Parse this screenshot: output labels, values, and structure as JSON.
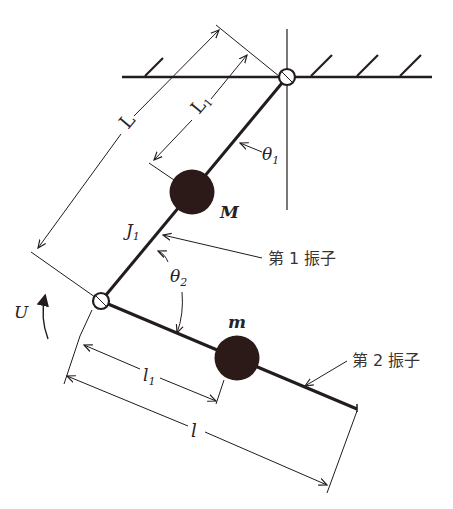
{
  "diagram": {
    "colors": {
      "ink": "#231c1c",
      "mass": "#2b1a17",
      "background": "#ffffff"
    },
    "labels": {
      "L": "L",
      "L1": "L",
      "L1_sub": "1",
      "theta1": "θ",
      "theta1_sub": "1",
      "M": "M",
      "J1": "J",
      "J1_sub": "1",
      "theta2": "θ",
      "theta2_sub": "2",
      "pendulum1": "第 1 振子",
      "pendulum2": "第 2 振子",
      "U": "U",
      "m": "m",
      "l1": "l",
      "l1_sub": "1",
      "l": "l"
    },
    "components": [
      {
        "name": "ceiling",
        "type": "fixed-support"
      },
      {
        "name": "pivot",
        "type": "hinge"
      },
      {
        "name": "first-pendulum",
        "type": "link",
        "mass": "M",
        "inertia": "J1",
        "length": "L",
        "com_distance": "L1",
        "angle": "θ1"
      },
      {
        "name": "joint",
        "type": "hinge"
      },
      {
        "name": "second-pendulum",
        "type": "link",
        "mass": "m",
        "length": "l",
        "com_distance": "l1",
        "angle": "θ2"
      },
      {
        "name": "input-torque",
        "type": "torque",
        "label": "U"
      }
    ]
  }
}
